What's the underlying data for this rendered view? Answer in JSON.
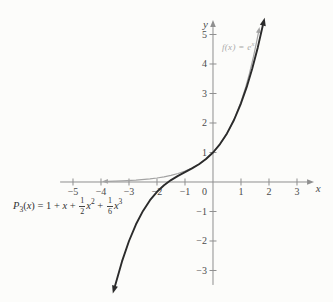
{
  "figure": {
    "background": "#fcfcfa",
    "axis_color": "#8f8f8f",
    "tick_label_color": "#4a4a4a"
  },
  "chart_data": {
    "type": "line",
    "title": "",
    "xlabel": "x",
    "ylabel": "y",
    "origin_label": "0",
    "grid": false,
    "xlim": [
      -7.607,
      4.286
    ],
    "ylim": [
      -4.068,
      6.169
    ],
    "x_axis_extent": [
      -5.46,
      3.36
    ],
    "y_axis_extent": [
      -3.49,
      5.25
    ],
    "x_ticks": [
      -5,
      -4,
      -3,
      -2,
      -1,
      1,
      2,
      3
    ],
    "y_ticks": [
      -3,
      -2,
      -1,
      1,
      2,
      3,
      4,
      5
    ],
    "series": [
      {
        "name": "f(x) = e^x",
        "color": "#a3a3a3",
        "stroke_width": 1.2,
        "arrow_start": true,
        "arrow_end": true,
        "arrow_len": 6,
        "arrow_halfwidth": 2.4,
        "points": [
          [
            -3.75,
            0.0235
          ],
          [
            -3.25,
            0.0388
          ],
          [
            -2.75,
            0.0639
          ],
          [
            -2.25,
            0.1054
          ],
          [
            -2,
            0.1353
          ],
          [
            -1.75,
            0.1738
          ],
          [
            -1.5,
            0.2231
          ],
          [
            -1.25,
            0.2865
          ],
          [
            -1,
            0.3679
          ],
          [
            -0.75,
            0.4724
          ],
          [
            -0.5,
            0.6065
          ],
          [
            -0.25,
            0.7788
          ],
          [
            0,
            1
          ],
          [
            0.2,
            1.2214
          ],
          [
            0.4,
            1.4918
          ],
          [
            0.6,
            1.8221
          ],
          [
            0.8,
            2.2255
          ],
          [
            1,
            2.7183
          ],
          [
            1.15,
            3.1582
          ],
          [
            1.3,
            3.6693
          ],
          [
            1.45,
            4.2631
          ],
          [
            1.55,
            4.7147
          ],
          [
            1.62,
            5.0531
          ]
        ]
      },
      {
        "name": "P3(x) = 1 + x + (1/2)x^2 + (1/6)x^3",
        "color": "#2b2b2b",
        "stroke_width": 1.9,
        "arrow_start": true,
        "arrow_end": true,
        "arrow_len": 8,
        "arrow_halfwidth": 3,
        "points": [
          [
            -3.5,
            -3.5208
          ],
          [
            -3.25,
            -2.6901
          ],
          [
            -3,
            -2
          ],
          [
            -2.75,
            -1.4349
          ],
          [
            -2.5,
            -0.9792
          ],
          [
            -2.25,
            -0.6172
          ],
          [
            -2,
            -0.3333
          ],
          [
            -1.75,
            -0.112
          ],
          [
            -1.5,
            0.0625
          ],
          [
            -1.25,
            0.2057
          ],
          [
            -1,
            0.3333
          ],
          [
            -0.75,
            0.4609
          ],
          [
            -0.5,
            0.6042
          ],
          [
            -0.25,
            0.7799
          ],
          [
            0,
            1
          ],
          [
            0.25,
            1.2839
          ],
          [
            0.5,
            1.6458
          ],
          [
            0.75,
            2.1016
          ],
          [
            1,
            2.6667
          ],
          [
            1.2,
            3.208
          ],
          [
            1.4,
            3.8373
          ],
          [
            1.6,
            4.5627
          ],
          [
            1.78,
            5.3042
          ]
        ]
      }
    ],
    "annotations": {
      "exp_label": {
        "prefix": "f(x) = e",
        "sup": "x"
      },
      "p3_label": {
        "name": "P",
        "sub": "3",
        "open": "(",
        "var": "x",
        "eq_start": ") = 1 + ",
        "x1": "x",
        "plus1": " + ",
        "frac1_num": "1",
        "frac1_den": "2",
        "x2": "x",
        "sup2": "2",
        "plus2": " + ",
        "frac2_num": "1",
        "frac2_den": "6",
        "x3": "x",
        "sup3": "3"
      }
    }
  }
}
